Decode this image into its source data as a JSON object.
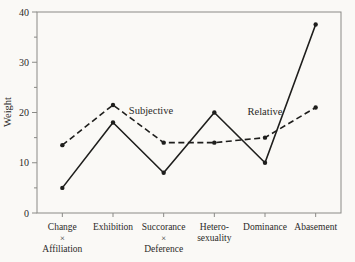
{
  "figure": {
    "background": "#faf9f6",
    "ink_color": "#1e1e1c",
    "frame_color": "#8a8a86",
    "text_color": "#2a2a28"
  },
  "chart_data": {
    "type": "line",
    "title": "",
    "xlabel": "",
    "ylabel": "Weight",
    "ylim": [
      0,
      40
    ],
    "yticks": [
      0,
      10,
      20,
      30,
      40
    ],
    "minor_yticks": [
      5,
      15,
      25,
      35
    ],
    "grid": false,
    "boxed_plot_area": true,
    "legend_position": "inline-annotations",
    "categories": [
      {
        "lines": [
          "Change",
          "×",
          "Affiliation"
        ]
      },
      {
        "lines": [
          "Exhibition"
        ]
      },
      {
        "lines": [
          "Succorance",
          "×",
          "Deference"
        ]
      },
      {
        "lines": [
          "Hetero-",
          "sexuality"
        ]
      },
      {
        "lines": [
          "Dominance"
        ]
      },
      {
        "lines": [
          "Abasement"
        ]
      }
    ],
    "series": [
      {
        "name": "Subjective",
        "style": "dashed",
        "marker": "dot",
        "values": [
          13.5,
          21.5,
          14,
          14,
          15,
          21
        ]
      },
      {
        "name": "Relative",
        "style": "solid",
        "marker": "dot",
        "values": [
          5,
          18,
          8,
          20,
          10,
          37.5
        ]
      }
    ],
    "annotations": [
      {
        "text": "Subjective",
        "series": "Subjective",
        "x_index": 1.75,
        "y_value": 20.3
      },
      {
        "text": "Relative",
        "series": "Relative",
        "x_index": 4.0,
        "y_value": 20.1
      }
    ]
  }
}
